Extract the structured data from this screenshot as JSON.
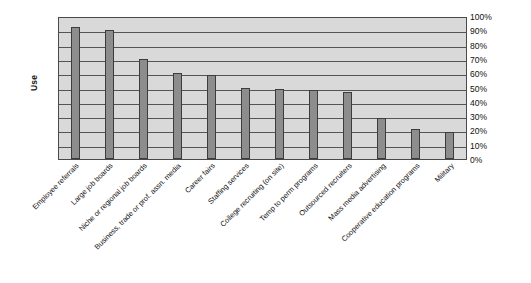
{
  "chart_data": {
    "type": "bar",
    "title": "",
    "xlabel": "",
    "ylabel": "Use",
    "ylim": [
      0,
      100
    ],
    "yunit": "%",
    "grid": true,
    "legend": false,
    "orientation": "vertical",
    "y_tick_labels": [
      "100%",
      "90%",
      "80%",
      "70%",
      "60%",
      "50%",
      "40%",
      "30%",
      "20%",
      "10%",
      "0%"
    ],
    "y_ticks": [
      100,
      90,
      80,
      70,
      60,
      50,
      40,
      30,
      20,
      10,
      0
    ],
    "y_tick_position": "right",
    "categories": [
      "Employee referrals",
      "Large job boards",
      "Niche or regional job boards",
      "Business, trade or prof. assn. media",
      "Career fairs",
      "Staffing services",
      "College recruiting (on site)",
      "Temp to perm programs",
      "Outsourced recruiters",
      "Mass media advertising",
      "Cooperative education programs",
      "Military"
    ],
    "values": [
      92,
      90,
      70,
      60,
      59,
      50,
      49,
      48,
      47,
      29,
      21,
      19
    ],
    "series": [
      {
        "name": "Use",
        "values": [
          92,
          90,
          70,
          60,
          59,
          50,
          49,
          48,
          47,
          29,
          21,
          19
        ]
      }
    ],
    "colors": {
      "bar_fill": "#8d8d8d",
      "bar_border": "#3c3c3c",
      "plot_background": "#d9d9d9",
      "gridline": "#545454",
      "plot_border": "#4a4a4a",
      "page_background": "#ffffff",
      "text": "#111111"
    }
  }
}
